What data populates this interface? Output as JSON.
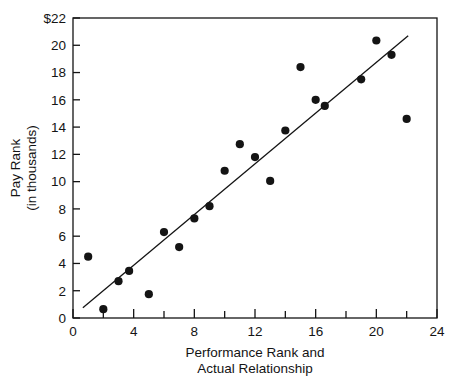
{
  "figure": {
    "clipped_header_text": "",
    "background_color": "#ffffff",
    "ink_color": "#141414"
  },
  "axes": {
    "y_title_line1": "Pay Rank",
    "y_title_line2": "(in thousands)",
    "x_title_line1": "Performance Rank and",
    "x_title_line2": "Actual Relationship",
    "y_tick_labels": [
      "0",
      "2",
      "4",
      "6",
      "8",
      "10",
      "12",
      "14",
      "16",
      "18",
      "20",
      "$22"
    ],
    "x_tick_labels": [
      "0",
      "4",
      "8",
      "12",
      "16",
      "20",
      "24"
    ]
  },
  "chart_data": {
    "type": "scatter",
    "title": "",
    "xlabel": "Performance Rank and Actual Relationship",
    "ylabel": "Pay Rank (in thousands)",
    "xlim": [
      0,
      24
    ],
    "ylim": [
      0,
      22
    ],
    "x_ticks": [
      0,
      4,
      8,
      12,
      16,
      20,
      24
    ],
    "x_minor_ticks": [
      2,
      6,
      10,
      14,
      18,
      22
    ],
    "y_ticks": [
      0,
      2,
      4,
      6,
      8,
      10,
      12,
      14,
      16,
      18,
      20,
      22
    ],
    "y_tick_labels": [
      "0",
      "2",
      "4",
      "6",
      "8",
      "10",
      "12",
      "14",
      "16",
      "18",
      "20",
      "$22"
    ],
    "grid": false,
    "legend": null,
    "marker_color": "#141414",
    "marker_size_px": 6.4,
    "points": [
      {
        "x": 1.0,
        "y": 4.5
      },
      {
        "x": 2.0,
        "y": 0.65
      },
      {
        "x": 3.0,
        "y": 2.7
      },
      {
        "x": 3.7,
        "y": 3.45
      },
      {
        "x": 5.0,
        "y": 1.75
      },
      {
        "x": 6.0,
        "y": 6.3
      },
      {
        "x": 7.0,
        "y": 5.2
      },
      {
        "x": 8.0,
        "y": 7.3
      },
      {
        "x": 9.0,
        "y": 8.2
      },
      {
        "x": 10.0,
        "y": 10.8
      },
      {
        "x": 11.0,
        "y": 12.75
      },
      {
        "x": 12.0,
        "y": 11.8
      },
      {
        "x": 13.0,
        "y": 10.05
      },
      {
        "x": 14.0,
        "y": 13.75
      },
      {
        "x": 15.0,
        "y": 18.4
      },
      {
        "x": 16.0,
        "y": 16.0
      },
      {
        "x": 16.6,
        "y": 15.55
      },
      {
        "x": 19.0,
        "y": 17.5
      },
      {
        "x": 20.0,
        "y": 20.35
      },
      {
        "x": 21.0,
        "y": 19.3
      },
      {
        "x": 22.0,
        "y": 14.6
      }
    ],
    "trend_line": {
      "name": "actual relationship",
      "x0": 0.65,
      "y0": 0.75,
      "x1": 22.1,
      "y1": 20.7,
      "color": "#141414",
      "width_px": 1.3
    }
  }
}
